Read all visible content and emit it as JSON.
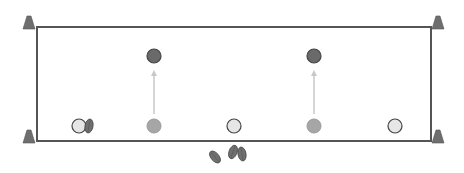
{
  "diagram": {
    "type": "sports-drill",
    "field": {
      "x": 37,
      "y": 27,
      "width": 394,
      "height": 114,
      "stroke": "#555555"
    },
    "cones": [
      {
        "name": "cone-top-left",
        "x": 29,
        "y": 27
      },
      {
        "name": "cone-top-right",
        "x": 438,
        "y": 27
      },
      {
        "name": "cone-bottom-left",
        "x": 29,
        "y": 141
      },
      {
        "name": "cone-bottom-right",
        "x": 438,
        "y": 141
      }
    ],
    "players_white": [
      {
        "x": 79,
        "y": 126
      },
      {
        "x": 234,
        "y": 126
      },
      {
        "x": 395,
        "y": 126
      }
    ],
    "players_mid_grey": [
      {
        "x": 154,
        "y": 126
      },
      {
        "x": 314,
        "y": 126
      }
    ],
    "players_dark": [
      {
        "x": 154,
        "y": 56
      },
      {
        "x": 314,
        "y": 56
      }
    ],
    "arrows": [
      {
        "x": 154,
        "y1": 114,
        "y2": 70
      },
      {
        "x": 314,
        "y1": 114,
        "y2": 70
      }
    ],
    "balls": [
      {
        "x": 89,
        "y": 126,
        "rot": 10
      },
      {
        "x": 215,
        "y": 157,
        "rot": -40
      },
      {
        "x": 233,
        "y": 152,
        "rot": 20
      },
      {
        "x": 242,
        "y": 154,
        "rot": -10
      }
    ],
    "colors": {
      "cone": "#6e6e6e",
      "player_white": "#e6e6e6",
      "player_mid": "#a6a6a6",
      "player_dark": "#6a6a6a",
      "arrow": "#c8c8c8",
      "ball": "#707070"
    }
  }
}
